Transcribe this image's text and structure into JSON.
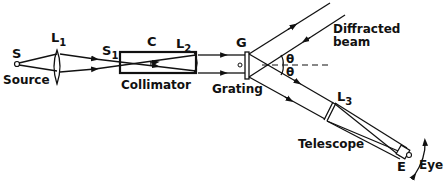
{
  "diagram": {
    "labels": {
      "source_point": "S",
      "source": "Source",
      "lens1": "L",
      "lens1_sub": "1",
      "slit": "S",
      "slit_sub": "1",
      "collimator_letter": "C",
      "lens2": "L",
      "lens2_sub": "2",
      "collimator": "Collimator",
      "grating_letter": "G",
      "grating": "Grating",
      "theta_upper": "θ",
      "theta_lower": "θ",
      "diffracted_line1": "Diffracted",
      "diffracted_line2": "beam",
      "lens3": "L",
      "lens3_sub": "3",
      "telescope": "Telescope",
      "eyepiece": "E",
      "eye": "Eye"
    },
    "colors": {
      "ink": "#111111",
      "background": "#ffffff"
    }
  }
}
